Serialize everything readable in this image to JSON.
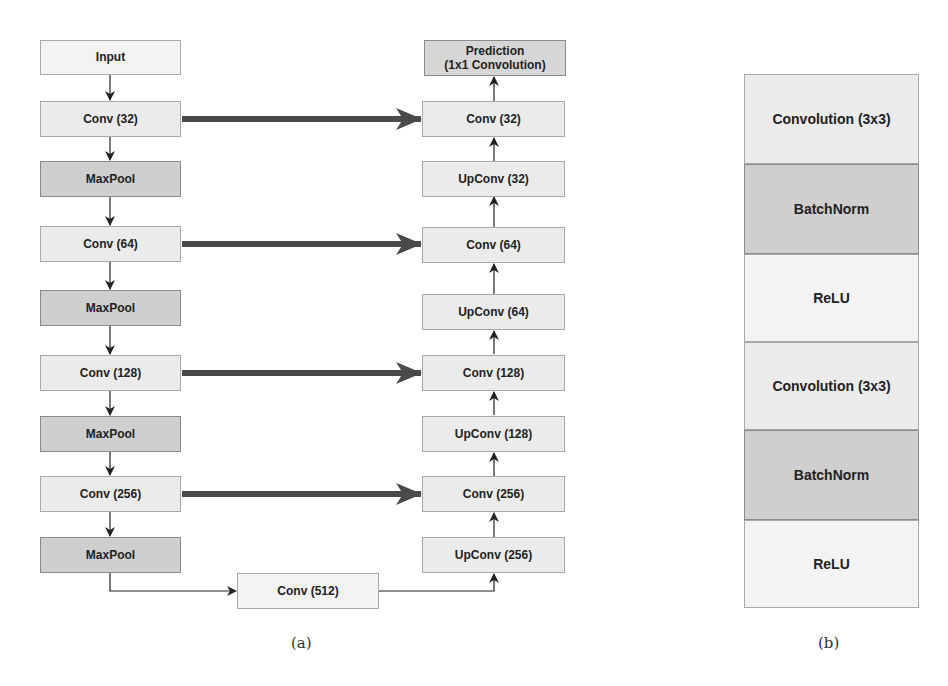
{
  "figure_a": {
    "caption": "(a)",
    "encoder": [
      {
        "label": "Input",
        "type": "input"
      },
      {
        "label": "Conv (32)",
        "type": "conv"
      },
      {
        "label": "MaxPool",
        "type": "pool"
      },
      {
        "label": "Conv (64)",
        "type": "conv"
      },
      {
        "label": "MaxPool",
        "type": "pool"
      },
      {
        "label": "Conv (128)",
        "type": "conv"
      },
      {
        "label": "MaxPool",
        "type": "pool"
      },
      {
        "label": "Conv (256)",
        "type": "conv"
      },
      {
        "label": "MaxPool",
        "type": "pool"
      }
    ],
    "bottleneck": {
      "label": "Conv (512)"
    },
    "decoder": [
      {
        "label": "Prediction\n(1x1 Convolution)",
        "line1": "Prediction",
        "line2": "(1x1 Convolution)",
        "type": "output"
      },
      {
        "label": "Conv (32)",
        "type": "conv"
      },
      {
        "label": "UpConv (32)",
        "type": "upconv"
      },
      {
        "label": "Conv (64)",
        "type": "conv"
      },
      {
        "label": "UpConv (64)",
        "type": "upconv"
      },
      {
        "label": "Conv (128)",
        "type": "conv"
      },
      {
        "label": "UpConv (128)",
        "type": "upconv"
      },
      {
        "label": "Conv (256)",
        "type": "conv"
      },
      {
        "label": "UpConv (256)",
        "type": "upconv"
      }
    ],
    "skip_connections": [
      {
        "from": "Conv (32)",
        "to": "Conv (32)"
      },
      {
        "from": "Conv (64)",
        "to": "Conv (64)"
      },
      {
        "from": "Conv (128)",
        "to": "Conv (128)"
      },
      {
        "from": "Conv (256)",
        "to": "Conv (256)"
      }
    ]
  },
  "figure_b": {
    "caption": "(b)",
    "layers": [
      {
        "label": "Convolution (3x3)",
        "shade": "light"
      },
      {
        "label": "BatchNorm",
        "shade": "dark"
      },
      {
        "label": "ReLU",
        "shade": "lighter"
      },
      {
        "label": "Convolution (3x3)",
        "shade": "light"
      },
      {
        "label": "BatchNorm",
        "shade": "dark"
      },
      {
        "label": "ReLU",
        "shade": "lighter"
      }
    ]
  },
  "colors": {
    "conv_fill": "#ebebeb",
    "pool_fill": "#cfcfcf",
    "relu_fill": "#f3f3f3",
    "skip_arrow": "#555555",
    "line": "#333333"
  }
}
